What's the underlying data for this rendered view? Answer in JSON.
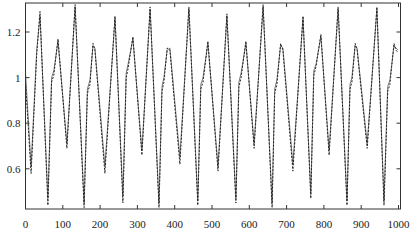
{
  "chart_data": {
    "type": "line",
    "title": "",
    "xlabel": "",
    "ylabel": "",
    "xlim": [
      0,
      1000
    ],
    "ylim": [
      0.425,
      1.327
    ],
    "grid": false,
    "legend": null,
    "x_ticks": [
      0,
      100,
      200,
      300,
      400,
      500,
      600,
      700,
      800,
      900,
      1000
    ],
    "x_tick_labels": [
      "0",
      "100",
      "200",
      "300",
      "400",
      "500",
      "600",
      "700",
      "800",
      "900",
      "1000"
    ],
    "y_ticks": [
      0.6,
      0.8,
      1.0,
      1.2
    ],
    "y_tick_labels": [
      "0.6",
      "0.8",
      "1",
      "1.2"
    ],
    "series": [
      {
        "name": "solid",
        "style": "solid",
        "color": "#555555",
        "x": [
          0,
          15,
          30,
          39,
          60,
          70,
          76,
          87,
          111,
          133,
          157,
          166,
          173,
          181,
          186,
          213,
          240,
          261,
          270,
          275,
          288,
          312,
          334,
          358,
          366,
          371,
          380,
          387,
          414,
          438,
          462,
          470,
          476,
          489,
          516,
          540,
          564,
          572,
          578,
          591,
          613,
          637,
          661,
          668,
          674,
          684,
          690,
          717,
          744,
          765,
          773,
          779,
          792,
          814,
          838,
          862,
          870,
          875,
          884,
          889,
          916,
          942,
          961,
          971,
          977,
          988,
          993,
          999
        ],
        "y": [
          1.02,
          0.61,
          1.12,
          1.27,
          0.47,
          1.0,
          1.03,
          1.16,
          0.71,
          1.31,
          0.45,
          0.95,
          0.99,
          1.14,
          1.13,
          0.61,
          1.26,
          0.48,
          1.02,
          1.06,
          1.17,
          0.68,
          1.3,
          0.45,
          0.96,
          1.0,
          1.12,
          1.13,
          0.65,
          1.3,
          0.46,
          0.97,
          1.0,
          1.15,
          0.61,
          1.27,
          0.47,
          0.98,
          1.02,
          1.15,
          0.71,
          1.31,
          0.45,
          0.95,
          0.99,
          1.14,
          1.13,
          0.62,
          1.26,
          0.49,
          1.03,
          1.06,
          1.18,
          0.68,
          1.3,
          0.46,
          0.97,
          1.0,
          1.14,
          1.13,
          0.71,
          1.3,
          0.46,
          0.96,
          0.99,
          1.14,
          1.13,
          1.12
        ]
      },
      {
        "name": "dashed",
        "style": "dashed",
        "color": "#222222",
        "x": [
          0,
          15,
          30,
          39,
          60,
          70,
          76,
          87,
          111,
          133,
          157,
          166,
          173,
          181,
          186,
          213,
          240,
          261,
          270,
          275,
          288,
          312,
          334,
          358,
          366,
          371,
          380,
          387,
          414,
          438,
          462,
          470,
          476,
          489,
          516,
          540,
          564,
          572,
          578,
          591,
          613,
          637,
          661,
          668,
          674,
          684,
          690,
          717,
          744,
          765,
          773,
          779,
          792,
          814,
          838,
          862,
          870,
          875,
          884,
          889,
          916,
          942,
          961,
          971,
          977,
          988,
          993,
          999
        ],
        "y": [
          0.98,
          0.58,
          1.1,
          1.29,
          0.44,
          0.98,
          1.01,
          1.17,
          0.69,
          1.32,
          0.43,
          0.93,
          0.97,
          1.15,
          1.12,
          0.58,
          1.27,
          0.45,
          1.0,
          1.04,
          1.18,
          0.66,
          1.31,
          0.43,
          0.94,
          0.98,
          1.13,
          1.12,
          0.62,
          1.31,
          0.44,
          0.95,
          0.98,
          1.16,
          0.59,
          1.28,
          0.45,
          0.96,
          1.0,
          1.16,
          0.69,
          1.32,
          0.43,
          0.93,
          0.97,
          1.15,
          1.12,
          0.59,
          1.27,
          0.47,
          1.01,
          1.05,
          1.19,
          0.66,
          1.31,
          0.44,
          0.95,
          0.98,
          1.15,
          1.12,
          0.69,
          1.31,
          0.44,
          0.94,
          0.97,
          1.15,
          1.12,
          1.11
        ]
      }
    ],
    "layout": {
      "plot_left": 25.5,
      "plot_right": 400.5,
      "plot_top": 3,
      "plot_bottom": 209,
      "x_scale_px_per_unit": 0.373,
      "x_zero_px": 25.5,
      "y_ref_value": 1.2,
      "y_ref_px": 32,
      "y_px_per_unit": 228
    }
  }
}
